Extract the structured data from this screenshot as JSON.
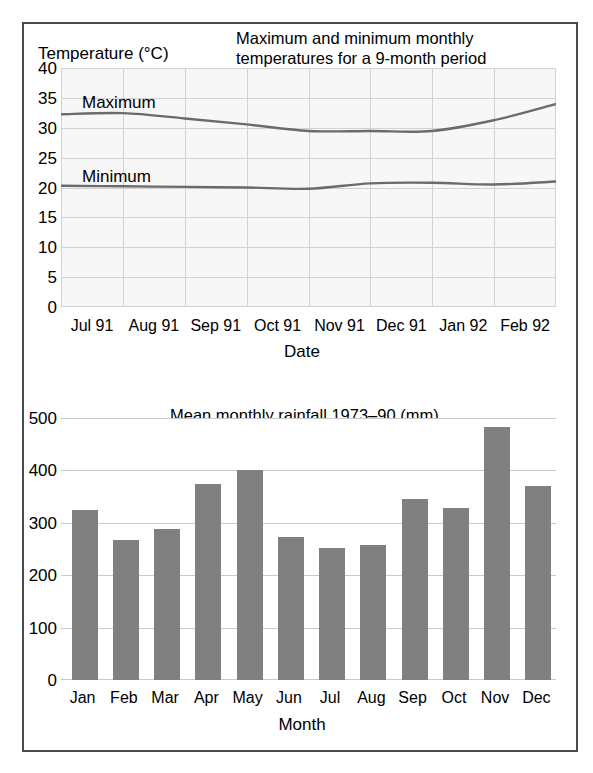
{
  "temperature": {
    "title": "Maximum and minimum monthly temperatures for a 9-month period",
    "title_line1": "Maximum and minimum monthly",
    "title_line2": "temperatures for a 9-month period",
    "y_axis_title": "Temperature (°C)",
    "x_axis_title": "Date",
    "max_label": "Maximum",
    "min_label": "Minimum",
    "y_ticks": [
      "40",
      "35",
      "30",
      "25",
      "20",
      "15",
      "10",
      "5",
      "0"
    ],
    "x_ticks": [
      "Jul 91",
      "Aug 91",
      "Sep 91",
      "Oct 91",
      "Nov 91",
      "Dec 91",
      "Jan 92",
      "Feb 92",
      "Mar 92"
    ]
  },
  "rainfall": {
    "title": "Mean monthly rainfall 1973–90 (mm)",
    "x_axis_title": "Month",
    "y_ticks": [
      "500",
      "400",
      "300",
      "200",
      "100",
      "0"
    ],
    "x_ticks": [
      "Jan",
      "Feb",
      "Mar",
      "Apr",
      "May",
      "Jun",
      "Jul",
      "Aug",
      "Sep",
      "Oct",
      "Nov",
      "Dec"
    ]
  },
  "colors": {
    "line": "#6b6b6b",
    "bar": "#808080",
    "grid": "#d2d2d2",
    "frame": "#4a4a4a",
    "plot_background": "#f7f7f7"
  },
  "chart_data": [
    {
      "type": "line",
      "title": "Maximum and minimum monthly temperatures for a 9-month period",
      "xlabel": "Date",
      "ylabel": "Temperature (°C)",
      "ylim": [
        0,
        40
      ],
      "ytick_step": 5,
      "grid": true,
      "legend": "inline-labels",
      "categories": [
        "Jul 91",
        "Aug 91",
        "Sep 91",
        "Oct 91",
        "Nov 91",
        "Dec 91",
        "Jan 92",
        "Feb 92",
        "Mar 92"
      ],
      "series": [
        {
          "name": "Maximum",
          "values": [
            32.3,
            32.5,
            31.6,
            30.6,
            29.5,
            29.5,
            29.5,
            31.3,
            34.0
          ]
        },
        {
          "name": "Minimum",
          "values": [
            20.3,
            20.2,
            20.1,
            20.0,
            19.8,
            20.7,
            20.8,
            20.5,
            21.0
          ]
        }
      ]
    },
    {
      "type": "bar",
      "title": "Mean monthly rainfall 1973–90 (mm)",
      "xlabel": "Month",
      "ylabel": "",
      "ylim": [
        0,
        500
      ],
      "ytick_step": 100,
      "grid": true,
      "categories": [
        "Jan",
        "Feb",
        "Mar",
        "Apr",
        "May",
        "Jun",
        "Jul",
        "Aug",
        "Sep",
        "Oct",
        "Nov",
        "Dec"
      ],
      "values": [
        325,
        268,
        288,
        375,
        400,
        272,
        252,
        258,
        345,
        328,
        483,
        370
      ]
    }
  ]
}
